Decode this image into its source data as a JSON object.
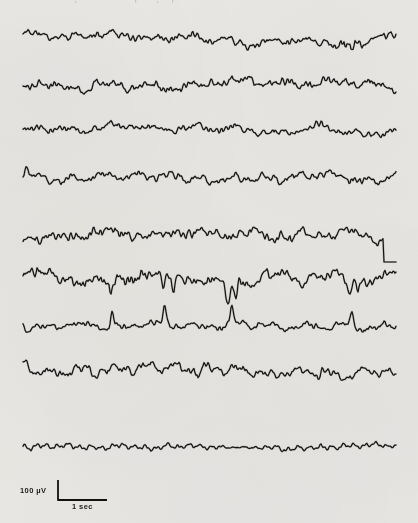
{
  "figure": {
    "kind": "eeg-polygraph-recording",
    "background_color": "#f3f2f0",
    "ink_color": "#111111",
    "width": 418,
    "height": 523
  },
  "calibration": {
    "amplitude_label": "100 µV",
    "time_label": "1 sec",
    "amplitude_value": 100,
    "amplitude_units": "µV",
    "time_value": 1,
    "time_units": "sec",
    "bar": {
      "corner_x": 58,
      "top_y": 480,
      "bottom_y": 500,
      "right_x": 107,
      "stroke_width": 1.8
    }
  },
  "plot_area": {
    "x_start": 23,
    "x_end": 396,
    "stroke_width": 1.15
  },
  "chart_data": {
    "type": "line",
    "title": "",
    "xlabel": "1 sec",
    "ylabel": "100 µV",
    "grid": false,
    "legend": false,
    "groups": [
      {
        "name": "group-1",
        "channel_indices": [
          0,
          1,
          2,
          3
        ]
      },
      {
        "name": "group-2",
        "channel_indices": [
          4,
          5,
          6,
          7
        ]
      },
      {
        "name": "group-3",
        "channel_indices": [
          8
        ]
      }
    ],
    "series": [
      {
        "name": "channel-1",
        "baseline_y": 35,
        "amplitude": 4.0,
        "base_freq": 9.5,
        "roughness": 0.85,
        "seed": 11,
        "character": "low-voltage-irregular",
        "events": [
          {
            "type": "burst",
            "x": 352,
            "width": 30,
            "gain": 2.1
          }
        ]
      },
      {
        "name": "channel-2",
        "baseline_y": 83,
        "amplitude": 4.6,
        "base_freq": 8.2,
        "roughness": 0.9,
        "seed": 27,
        "character": "low-voltage-irregular",
        "events": []
      },
      {
        "name": "channel-3",
        "baseline_y": 131,
        "amplitude": 3.8,
        "base_freq": 9.0,
        "roughness": 0.8,
        "seed": 43,
        "character": "low-voltage-irregular",
        "events": []
      },
      {
        "name": "channel-4",
        "baseline_y": 178,
        "amplitude": 4.4,
        "base_freq": 11.5,
        "roughness": 0.75,
        "seed": 58,
        "character": "rhythmic-alpha",
        "events": [
          {
            "type": "spike-up",
            "x": 26,
            "height": 9,
            "width": 3
          }
        ]
      },
      {
        "name": "channel-5",
        "baseline_y": 236,
        "amplitude": 5.0,
        "base_freq": 7.5,
        "roughness": 0.95,
        "seed": 71,
        "character": "drifting-mixed",
        "events": [
          {
            "type": "step-down",
            "x": 384,
            "depth": 26,
            "flat_to": 396
          }
        ]
      },
      {
        "name": "channel-6",
        "baseline_y": 275,
        "amplitude": 5.5,
        "base_freq": 6.5,
        "roughness": 1.0,
        "seed": 89,
        "character": "sharp-negative-transients",
        "events": [
          {
            "type": "spike-down",
            "x": 111,
            "height": 20,
            "width": 2.6
          },
          {
            "type": "spike-down",
            "x": 163,
            "height": 19,
            "width": 2.4
          },
          {
            "type": "spike-down",
            "x": 173,
            "height": 17,
            "width": 2.4
          },
          {
            "type": "spike-down",
            "x": 228,
            "height": 21,
            "width": 2.6
          },
          {
            "type": "spike-down",
            "x": 236,
            "height": 13,
            "width": 2.2
          },
          {
            "type": "spike-down",
            "x": 349,
            "height": 14,
            "width": 2.4
          },
          {
            "type": "spike-down",
            "x": 358,
            "height": 11,
            "width": 2.2
          }
        ]
      },
      {
        "name": "channel-7",
        "baseline_y": 325,
        "amplitude": 3.4,
        "base_freq": 10.0,
        "roughness": 0.85,
        "seed": 103,
        "character": "sharp-positive-transients",
        "events": [
          {
            "type": "spike-up",
            "x": 112,
            "height": 15,
            "width": 2.2
          },
          {
            "type": "spike-up",
            "x": 165,
            "height": 17,
            "width": 2.4
          },
          {
            "type": "spike-up",
            "x": 232,
            "height": 16,
            "width": 2.4
          },
          {
            "type": "spike-up",
            "x": 352,
            "height": 11,
            "width": 2.2
          }
        ]
      },
      {
        "name": "channel-8",
        "baseline_y": 373,
        "amplitude": 5.2,
        "base_freq": 12.0,
        "roughness": 0.7,
        "seed": 127,
        "character": "rhythmic-theta-alpha",
        "events": [
          {
            "type": "spike-up",
            "x": 26,
            "height": 10,
            "width": 3
          },
          {
            "type": "burst",
            "x": 196,
            "width": 26,
            "gain": 1.7
          }
        ]
      },
      {
        "name": "channel-9",
        "baseline_y": 447,
        "amplitude": 3.0,
        "base_freq": 34.0,
        "roughness": 0.22,
        "seed": 149,
        "character": "fast-regular-oscillation",
        "events": [
          {
            "type": "attenuate",
            "x": 240,
            "width": 58,
            "gain": 0.32
          }
        ]
      }
    ]
  }
}
